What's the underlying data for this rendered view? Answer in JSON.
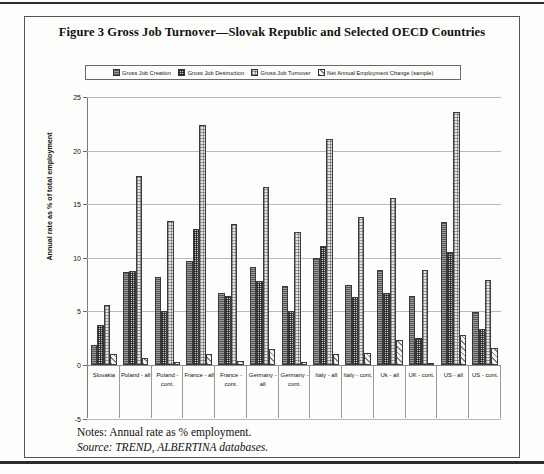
{
  "figure": {
    "title": "Figure 3  Gross Job Turnover—Slovak Republic and Selected OECD Countries",
    "notes": "Notes: Annual rate as % employment.",
    "source": "Source: TREND, ALBERTINA databases."
  },
  "chart_data": {
    "type": "bar",
    "title": "Figure 3  Gross Job Turnover—Slovak Republic and Selected OECD Countries",
    "xlabel": "",
    "ylabel": "Annual rate as % of total employment",
    "ylim": [
      -5,
      25
    ],
    "yticks": [
      -5,
      0,
      5,
      10,
      15,
      20,
      25
    ],
    "ytick_labels": [
      "-5",
      "0",
      "5",
      "10",
      "15",
      "20",
      "25"
    ],
    "grid": true,
    "legend_position": "top",
    "categories": [
      "Slovakia",
      "Poland - all",
      "Poland - cont.",
      "France - all",
      "France - cont.",
      "Germany - all",
      "Germany -cont.",
      "Italy - all",
      "Italy - cont.",
      "Uk - all",
      "UK - cont.",
      "US - all",
      "US - cont."
    ],
    "series": [
      {
        "name": "Gross Job Creation",
        "pattern": "solid-dark",
        "values": [
          1.9,
          8.7,
          8.2,
          9.7,
          6.7,
          9.1,
          7.4,
          10.0,
          7.5,
          8.9,
          6.4,
          13.3,
          4.9
        ]
      },
      {
        "name": "Gross Job Destruction",
        "pattern": "checker-dense",
        "values": [
          3.7,
          8.8,
          5.0,
          12.7,
          6.4,
          7.8,
          5.0,
          11.1,
          6.3,
          6.7,
          2.5,
          10.5,
          3.4
        ]
      },
      {
        "name": "Gross Job Turnover",
        "pattern": "checker-light",
        "values": [
          5.6,
          17.6,
          13.4,
          22.4,
          13.2,
          16.6,
          12.4,
          21.1,
          13.8,
          15.6,
          8.9,
          23.6,
          7.9
        ]
      },
      {
        "name": "Net Annual Employment Change (sample)",
        "pattern": "diagonal-hatch",
        "values": [
          1.0,
          0.7,
          0.3,
          1.0,
          0.4,
          1.5,
          0.3,
          1.0,
          1.1,
          2.3,
          0.2,
          2.8,
          1.6
        ]
      }
    ]
  },
  "legend": {
    "items": [
      {
        "label": "Gross Job Creation"
      },
      {
        "label": "Gross Job Destruction"
      },
      {
        "label": "Gross Job Turnover"
      },
      {
        "label": "Net Annual Employment Change (sample)"
      }
    ]
  }
}
